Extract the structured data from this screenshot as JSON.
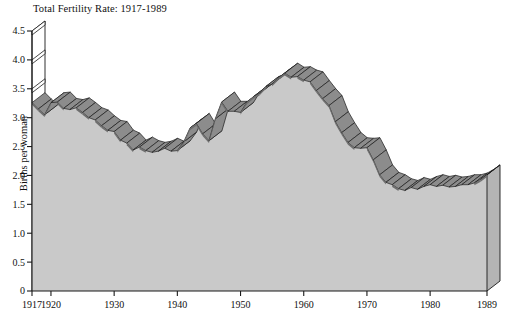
{
  "chart_data": {
    "type": "area",
    "title": "Total Fertility Rate: 1917-1989",
    "xlabel": "",
    "ylabel": "Births per woman",
    "xlim": [
      1917,
      1989
    ],
    "ylim": [
      0,
      4.5
    ],
    "grid": false,
    "legend": "none",
    "style3d": true,
    "colors": {
      "fill": "#c9c9c9",
      "ribbon_top": "#8c8c8c",
      "ribbon_side": "#6e6e6e",
      "backwall": "#ffffff",
      "axis": "#1a1a1a"
    },
    "ytick_values": [
      0,
      0.5,
      1.0,
      1.5,
      2.0,
      2.5,
      3.0,
      3.5,
      4.0,
      4.5
    ],
    "ytick_labels": [
      "0",
      "0.5",
      "1.0",
      "1.5",
      "2.0",
      "2.5",
      "3.0",
      "3.5",
      "4.0",
      "4.5"
    ],
    "xtick_values": [
      1917,
      1920,
      1930,
      1940,
      1950,
      1960,
      1970,
      1980,
      1989
    ],
    "xtick_labels": [
      "1917",
      "1920",
      "1930",
      "1940",
      "1950",
      "1960",
      "1970",
      "1980",
      "1989"
    ],
    "x": [
      1917,
      1918,
      1919,
      1920,
      1921,
      1922,
      1923,
      1924,
      1925,
      1926,
      1927,
      1928,
      1929,
      1930,
      1931,
      1932,
      1933,
      1934,
      1935,
      1936,
      1937,
      1938,
      1939,
      1940,
      1941,
      1942,
      1943,
      1944,
      1945,
      1946,
      1947,
      1948,
      1949,
      1950,
      1951,
      1952,
      1953,
      1954,
      1955,
      1956,
      1957,
      1958,
      1959,
      1960,
      1961,
      1962,
      1963,
      1964,
      1965,
      1966,
      1967,
      1968,
      1969,
      1970,
      1971,
      1972,
      1973,
      1974,
      1975,
      1976,
      1977,
      1978,
      1979,
      1980,
      1981,
      1982,
      1983,
      1984,
      1985,
      1986,
      1987,
      1988,
      1989
    ],
    "values": [
      3.26,
      3.15,
      3.05,
      3.26,
      3.27,
      3.16,
      3.14,
      3.17,
      3.09,
      3.0,
      2.96,
      2.86,
      2.78,
      2.76,
      2.61,
      2.56,
      2.44,
      2.49,
      2.43,
      2.4,
      2.42,
      2.47,
      2.42,
      2.43,
      2.58,
      2.82,
      2.9,
      2.72,
      2.6,
      2.98,
      3.27,
      3.11,
      3.11,
      3.09,
      3.27,
      3.36,
      3.42,
      3.54,
      3.58,
      3.69,
      3.77,
      3.7,
      3.71,
      3.65,
      3.62,
      3.47,
      3.33,
      3.21,
      2.93,
      2.74,
      2.57,
      2.48,
      2.47,
      2.48,
      2.27,
      2.01,
      1.88,
      1.84,
      1.77,
      1.74,
      1.79,
      1.76,
      1.81,
      1.84,
      1.81,
      1.83,
      1.8,
      1.81,
      1.84,
      1.84,
      1.87,
      1.93,
      2.01
    ]
  }
}
